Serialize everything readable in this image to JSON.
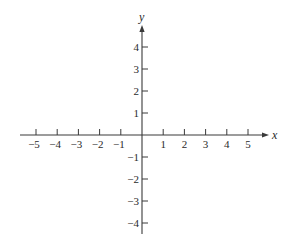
{
  "chart_data": {
    "type": "line",
    "title": "",
    "xlabel": "x",
    "ylabel": "y",
    "xlim": [
      -5,
      5
    ],
    "ylim": [
      -4,
      4
    ],
    "grid": false,
    "x_ticks": [
      -5,
      -4,
      -3,
      -2,
      -1,
      1,
      2,
      3,
      4,
      5
    ],
    "x_tick_labels": [
      "−5",
      "−4",
      "−3",
      "−2",
      "−1",
      "1",
      "2",
      "3",
      "4",
      "5"
    ],
    "y_ticks": [
      4,
      3,
      2,
      1,
      -1,
      -2,
      -3,
      -4
    ],
    "y_tick_labels": [
      "4",
      "3",
      "2",
      "1",
      "−1",
      "−2",
      "−3",
      "−4"
    ],
    "series": []
  },
  "colors": {
    "axis": "#3a3a3a",
    "text": "#2a2a2a",
    "background": "#ffffff"
  }
}
